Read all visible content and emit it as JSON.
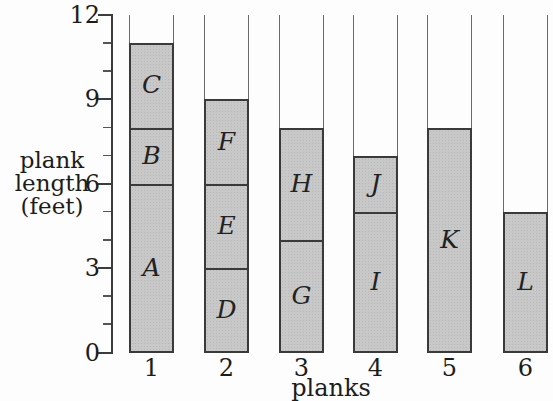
{
  "figure": {
    "background": "#fdfdfd",
    "bar_fill_color": "#c8c8c8",
    "segment_line_color": "#3a3a3a",
    "empty_frame_color": "#6a6a6a",
    "axis_color": "#3c3c3c",
    "text_color": "#1c1c1c"
  },
  "chart_data": {
    "type": "bar",
    "stacked": true,
    "title": "",
    "xlabel": "planks",
    "ylabel": "plank length (feet)",
    "ylabel_lines": [
      "plank",
      "length",
      "(feet)"
    ],
    "ylim": [
      0,
      12
    ],
    "ytick_major": [
      0,
      3,
      6,
      9,
      12
    ],
    "ytick_minor_step": 1,
    "grid": false,
    "legend": false,
    "bar_outline_to_top": true,
    "categories": [
      "1",
      "2",
      "3",
      "4",
      "5",
      "6"
    ],
    "bars": [
      {
        "category": "1",
        "total": 11,
        "segments": [
          {
            "label": "A",
            "from": 0,
            "to": 6
          },
          {
            "label": "B",
            "from": 6,
            "to": 8
          },
          {
            "label": "C",
            "from": 8,
            "to": 11
          }
        ]
      },
      {
        "category": "2",
        "total": 9,
        "segments": [
          {
            "label": "D",
            "from": 0,
            "to": 3
          },
          {
            "label": "E",
            "from": 3,
            "to": 6
          },
          {
            "label": "F",
            "from": 6,
            "to": 9
          }
        ]
      },
      {
        "category": "3",
        "total": 8,
        "segments": [
          {
            "label": "G",
            "from": 0,
            "to": 4
          },
          {
            "label": "H",
            "from": 4,
            "to": 8
          }
        ]
      },
      {
        "category": "4",
        "total": 7,
        "segments": [
          {
            "label": "I",
            "from": 0,
            "to": 5
          },
          {
            "label": "J",
            "from": 5,
            "to": 7
          }
        ]
      },
      {
        "category": "5",
        "total": 8,
        "segments": [
          {
            "label": "K",
            "from": 0,
            "to": 8
          }
        ]
      },
      {
        "category": "6",
        "total": 5,
        "segments": [
          {
            "label": "L",
            "from": 0,
            "to": 5
          }
        ]
      }
    ]
  }
}
